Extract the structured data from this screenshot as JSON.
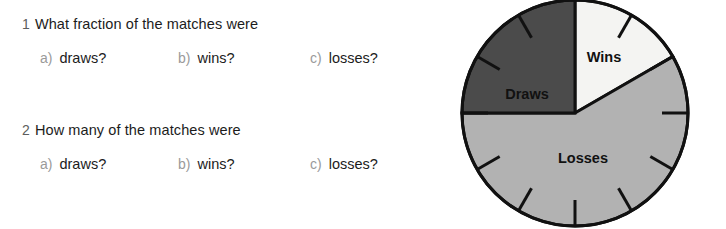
{
  "worksheet": {
    "questions": [
      {
        "number": "1",
        "stem": "What fraction of the matches were",
        "options": [
          {
            "letter": "a)",
            "text": "draws?"
          },
          {
            "letter": "b)",
            "text": "wins?"
          },
          {
            "letter": "c)",
            "text": "losses?"
          }
        ]
      },
      {
        "number": "2",
        "stem": "How many of the matches were",
        "options": [
          {
            "letter": "a)",
            "text": "draws?"
          },
          {
            "letter": "b)",
            "text": "wins?"
          },
          {
            "letter": "c)",
            "text": "losses?"
          }
        ]
      }
    ]
  },
  "chart_data": {
    "type": "pie",
    "title": "",
    "subtitle": "",
    "xlabel": "",
    "ylabel": "",
    "legend_position": "inside-slices",
    "grid": false,
    "note": "Clock-face style pie: 11 tick marks at hour positions 1 through 11; slice boundaries at 12 o'clock, 2 o'clock and 9 o'clock.",
    "start_angle_deg": 0,
    "direction": "clockwise",
    "tick_hours": [
      1,
      2,
      3,
      4,
      5,
      6,
      7,
      8,
      9,
      10,
      11
    ],
    "labels": [
      "Wins",
      "Losses",
      "Draws"
    ],
    "values": [
      2,
      7,
      3
    ],
    "fractions": [
      "2/12",
      "7/12",
      "3/12"
    ],
    "percentages": [
      16.7,
      58.3,
      25.0
    ],
    "angles_deg": [
      60,
      210,
      90
    ],
    "colors": [
      "#f4f4f2",
      "#b2b2b2",
      "#4b4b4b"
    ],
    "slices": [
      {
        "label": "Wins",
        "value": 2,
        "fraction": "2/12",
        "percent": 16.7,
        "start_deg": 0,
        "end_deg": 60,
        "color": "#f4f4f2",
        "label_x": 604,
        "label_y": 62
      },
      {
        "label": "Losses",
        "value": 7,
        "fraction": "7/12",
        "percent": 58.3,
        "start_deg": 60,
        "end_deg": 270,
        "color": "#b2b2b2",
        "label_x": 583,
        "label_y": 163
      },
      {
        "label": "Draws",
        "value": 3,
        "fraction": "3/12",
        "percent": 25.0,
        "start_deg": 270,
        "end_deg": 360,
        "color": "#4b4b4b",
        "label_x": 527,
        "label_y": 99
      }
    ],
    "geometry": {
      "center_x": 575,
      "center_y": 113,
      "radius": 113,
      "outline_color": "#111111",
      "outline_width": 3
    }
  },
  "colors": {
    "background": "#ffffff",
    "text": "#1c1c1c",
    "muted_text": "#9a9a9a",
    "question_number": "#5d5d5d",
    "wins": "#f4f4f2",
    "losses": "#b2b2b2",
    "draws": "#4b4b4b",
    "outline": "#111111"
  }
}
